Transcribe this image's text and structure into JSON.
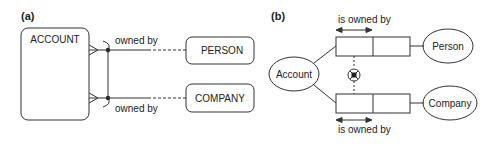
{
  "panel_a": {
    "label": "(a)",
    "entities": {
      "account": "ACCOUNT",
      "person": "PERSON",
      "company": "COMPANY"
    },
    "relationships": {
      "top": "owned by",
      "bottom": "owned by"
    }
  },
  "panel_b": {
    "label": "(b)",
    "objects": {
      "account": "Account",
      "person": "Person",
      "company": "Company"
    },
    "roles": {
      "top": "is owned by",
      "bottom": "is owned by"
    },
    "constraint": "exclusion"
  },
  "colors": {
    "stroke": "#333333",
    "text": "#222222",
    "background": "#ffffff"
  }
}
